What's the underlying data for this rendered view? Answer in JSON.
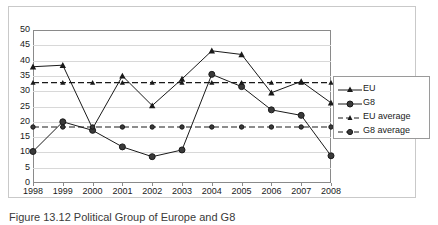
{
  "figure": {
    "caption": "Figure 13.12 Political Group of Europe and G8"
  },
  "chart_data": {
    "type": "line",
    "title": "",
    "xlabel": "",
    "ylabel": "",
    "grid": true,
    "legend_position": "right",
    "xlim": [
      1998,
      2008
    ],
    "ylim": [
      0,
      50
    ],
    "ytick_step": 5,
    "categories": [
      "1998",
      "1999",
      "2000",
      "2001",
      "2002",
      "2003",
      "2004",
      "2005",
      "2006",
      "2007",
      "2008"
    ],
    "ytick_labels": [
      "0",
      "5",
      "10",
      "15",
      "20",
      "25",
      "30",
      "35",
      "40",
      "45",
      "50"
    ],
    "series": [
      {
        "name": "EU",
        "marker": "triangle",
        "style": "solid",
        "color": "#1a1a1a",
        "values": [
          38.0,
          38.5,
          17.8,
          35.0,
          25.3,
          34.0,
          43.2,
          42.0,
          29.5,
          33.2,
          26.2
        ]
      },
      {
        "name": "G8",
        "marker": "circle",
        "style": "solid",
        "color": "#1a1a1a",
        "values": [
          10.3,
          20.0,
          17.2,
          11.8,
          8.6,
          10.8,
          35.5,
          31.5,
          23.9,
          22.1,
          8.9
        ]
      },
      {
        "name": "EU average",
        "marker": "triangle",
        "style": "dashed",
        "color": "#1a1a1a",
        "values": [
          32.8,
          32.8,
          32.8,
          32.8,
          32.8,
          32.8,
          32.8,
          32.8,
          32.8,
          32.8,
          32.8
        ]
      },
      {
        "name": "G8 average",
        "marker": "circle",
        "style": "dashed",
        "color": "#1a1a1a",
        "values": [
          18.3,
          18.3,
          18.3,
          18.3,
          18.3,
          18.3,
          18.3,
          18.3,
          18.3,
          18.3,
          18.3
        ]
      }
    ]
  },
  "legend": {
    "items": [
      {
        "label": "EU"
      },
      {
        "label": "G8"
      },
      {
        "label": "EU average"
      },
      {
        "label": "G8 average"
      }
    ]
  }
}
